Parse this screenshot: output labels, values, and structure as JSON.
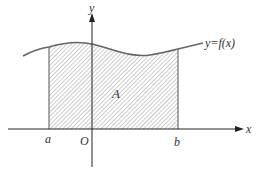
{
  "diagram": {
    "type": "definite-integral-area",
    "labels": {
      "y_axis": "y",
      "x_axis": "x",
      "origin": "O",
      "lower_bound": "a",
      "upper_bound": "b",
      "area": "A",
      "function": "y=f(x)"
    },
    "colors": {
      "axis": "#222222",
      "curve": "#666666",
      "hatch": "#9a9a9a",
      "text": "#333333"
    }
  }
}
